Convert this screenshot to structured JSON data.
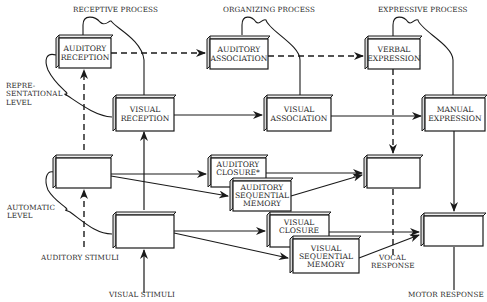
{
  "headers": {
    "receptive": "RECEPTIVE PROCESS",
    "organizing": "ORGANIZING PROCESS",
    "expressive": "EXPRESSIVE PROCESS"
  },
  "levels": {
    "representational_1": "REPRE-",
    "representational_2": "SENTATIONAL",
    "representational_3": "LEVEL",
    "automatic_1": "AUTOMATIC",
    "automatic_2": "LEVEL"
  },
  "boxes": {
    "auditory_reception": [
      "AUDITORY",
      "RECEPTION"
    ],
    "auditory_association": [
      "AUDITORY",
      "ASSOCIATION"
    ],
    "verbal_expression": [
      "VERBAL",
      "EXPRESSION"
    ],
    "visual_reception": [
      "VISUAL",
      "RECEPTION"
    ],
    "visual_association": [
      "VISUAL",
      "ASSOCIATION"
    ],
    "manual_expression": [
      "MANUAL",
      "EXPRESSION"
    ],
    "auditory_closure": [
      "AUDITORY",
      "CLOSURE*"
    ],
    "auditory_sequential_memory": [
      "AUDITORY",
      "SEQUENTIAL",
      "MEMORY"
    ],
    "visual_closure": [
      "VISUAL",
      "CLOSURE"
    ],
    "visual_sequential_memory": [
      "VISUAL",
      "SEQUENTIAL",
      "MEMORY"
    ]
  },
  "io": {
    "auditory_stimuli": "AUDITORY STIMULI",
    "visual_stimuli": "VISUAL STIMULI",
    "vocal_response_1": "VOCAL",
    "vocal_response_2": "RESPONSE",
    "motor_response": "MOTOR RESPONSE"
  },
  "colors": {
    "ink": "#1a1a1a",
    "background": "#ffffff"
  }
}
